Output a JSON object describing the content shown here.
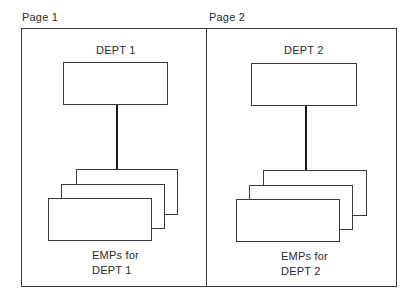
{
  "diagram": {
    "pages": [
      {
        "label": "Page 1",
        "parent": {
          "label": "DEPT 1"
        },
        "children": {
          "label_line1": "EMPs for",
          "label_line2": "DEPT 1",
          "stack_count": 3
        }
      },
      {
        "label": "Page 2",
        "parent": {
          "label": "DEPT 2"
        },
        "children": {
          "label_line1": "EMPs for",
          "label_line2": "DEPT 2",
          "stack_count": 3
        }
      }
    ],
    "colors": {
      "line": "#3a3a3a",
      "connector": "#1a1a1a",
      "text": "#2a2a2a",
      "background": "#ffffff"
    }
  }
}
